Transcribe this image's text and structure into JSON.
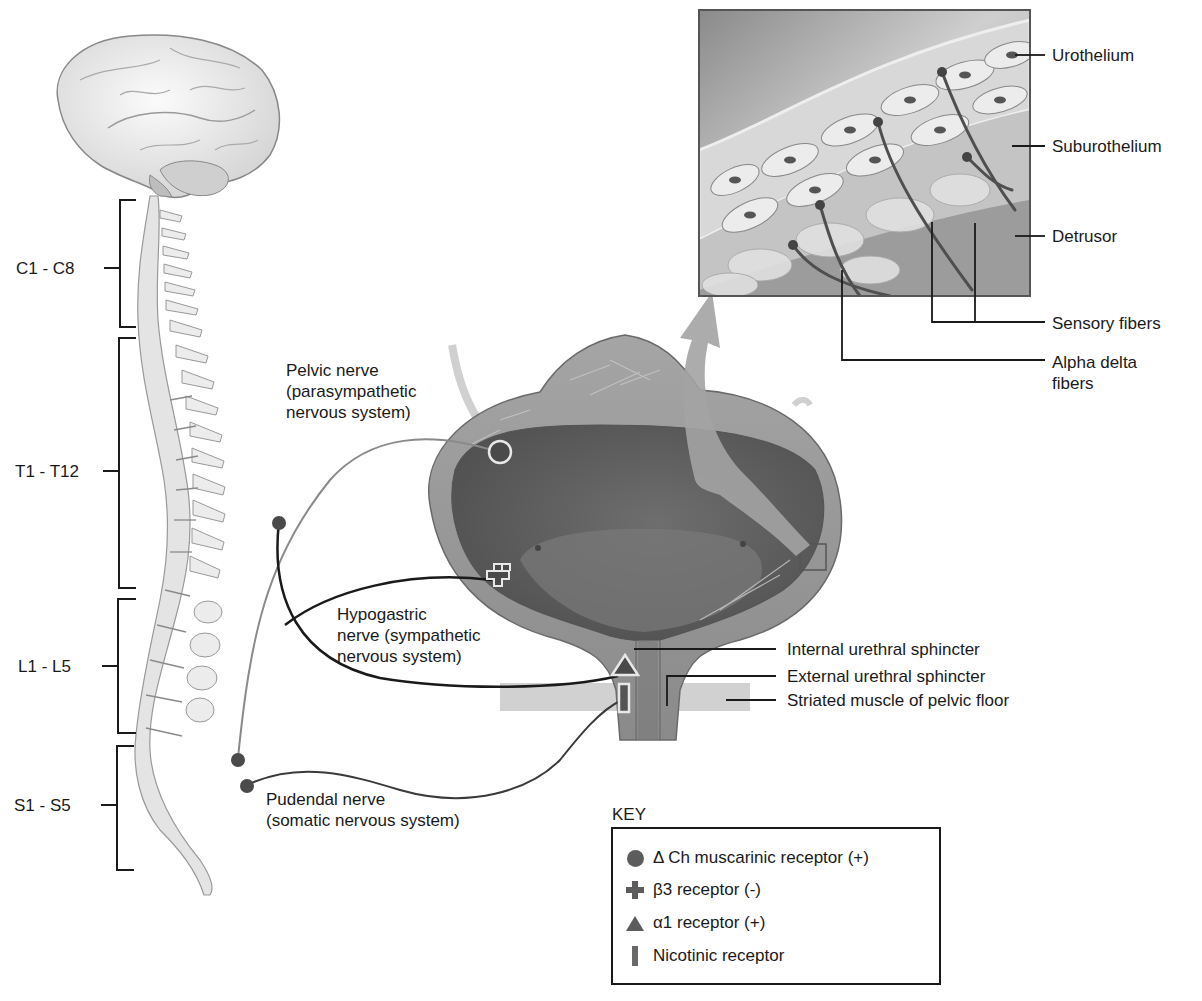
{
  "diagram": {
    "spine_segments": [
      {
        "id": "cervical",
        "label": "C1 - C8"
      },
      {
        "id": "thoracic",
        "label": "T1 - T12"
      },
      {
        "id": "lumbar",
        "label": "L1 - L5"
      },
      {
        "id": "sacral",
        "label": "S1 - S5"
      }
    ],
    "nerves": {
      "pelvic": {
        "line1": "Pelvic nerve",
        "line2": "(parasympathetic",
        "line3": "nervous system)"
      },
      "hypogastric": {
        "line1": "Hypogastric",
        "line2": "nerve (sympathetic",
        "line3": "nervous system)"
      },
      "pudendal": {
        "line1": "Pudendal nerve",
        "line2": "(somatic nervous system)"
      }
    },
    "bladder_labels": {
      "internal_sphincter": "Internal urethral sphincter",
      "external_sphincter": "External urethral sphincter",
      "pelvic_floor": "Striated muscle of pelvic floor"
    },
    "inset_labels": {
      "urothelium": "Urothelium",
      "suburothelium": "Suburothelium",
      "detrusor": "Detrusor",
      "sensory_fibers": "Sensory fibers",
      "alpha_delta_line1": "Alpha delta",
      "alpha_delta_line2": "fibers"
    },
    "key": {
      "title": "KEY",
      "items": [
        {
          "symbol": "circle",
          "label": "Δ Ch muscarinic receptor (+)"
        },
        {
          "symbol": "plus",
          "label": "β3 receptor (-)"
        },
        {
          "symbol": "triangle",
          "label": "α1 receptor (+)"
        },
        {
          "symbol": "bar",
          "label": "Nicotinic receptor"
        }
      ]
    },
    "colors": {
      "ink": "#1a1a1a",
      "bladder_wall": "#8c8c8c",
      "bladder_lumen": "#5e5e5e",
      "arrow": "#9a9a9a",
      "receptor": "#5c5c5c"
    }
  }
}
